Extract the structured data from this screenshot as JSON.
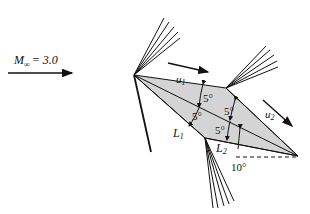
{
  "freestream": {
    "label_main": "M",
    "label_sub": "∞",
    "label_value": "= 3.0"
  },
  "velocity_labels": {
    "u1": {
      "main": "u",
      "sub": "1"
    },
    "u2": {
      "main": "u",
      "sub": "2"
    }
  },
  "length_labels": {
    "L1": {
      "main": "L",
      "sub": "1"
    },
    "L2": {
      "main": "L",
      "sub": "2"
    }
  },
  "angle_labels": {
    "upper_front": "5°",
    "lower_front": "5°",
    "upper_rear": "5°",
    "lower_rear": "5°",
    "incidence": "10°"
  },
  "colors": {
    "airfoil_fill": "#d4d4d4",
    "line": "#111111"
  }
}
